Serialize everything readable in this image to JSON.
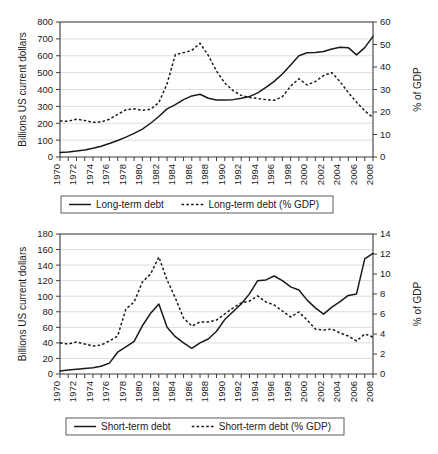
{
  "chart_data": [
    {
      "panel": "top",
      "type": "line",
      "title": "",
      "xlabel": "",
      "ylabel": "Billions US current dollars",
      "y2label": "% of GDP",
      "ylim": [
        0,
        800
      ],
      "yticks": [
        0,
        100,
        200,
        300,
        400,
        500,
        600,
        700,
        800
      ],
      "y2lim": [
        0,
        60
      ],
      "y2ticks": [
        0,
        10,
        20,
        30,
        40,
        50,
        60
      ],
      "grid": true,
      "legend_position": "below",
      "x": [
        1970,
        1971,
        1972,
        1973,
        1974,
        1975,
        1976,
        1977,
        1978,
        1979,
        1980,
        1981,
        1982,
        1983,
        1984,
        1985,
        1986,
        1987,
        1988,
        1989,
        1990,
        1991,
        1992,
        1993,
        1994,
        1995,
        1996,
        1997,
        1998,
        1999,
        2000,
        2001,
        2002,
        2003,
        2004,
        2005,
        2006,
        2007,
        2008
      ],
      "xticklabels": [
        "1970",
        "",
        "1972",
        "",
        "1974",
        "",
        "1976",
        "",
        "1978",
        "",
        "1980",
        "",
        "1982",
        "",
        "1984",
        "",
        "1986",
        "",
        "1988",
        "",
        "1990",
        "",
        "1992",
        "",
        "1994",
        "",
        "1996",
        "",
        "1998",
        "",
        "2000",
        "",
        "2002",
        "",
        "2004",
        "",
        "2006",
        "",
        "2008"
      ],
      "series": [
        {
          "name": "Long-term debt",
          "style": "solid",
          "axis": "left",
          "units": "Billions US current dollars",
          "values": [
            27,
            30,
            35,
            42,
            52,
            64,
            80,
            98,
            118,
            140,
            165,
            200,
            240,
            285,
            310,
            340,
            362,
            372,
            348,
            338,
            338,
            340,
            348,
            358,
            380,
            412,
            448,
            492,
            545,
            600,
            618,
            620,
            625,
            640,
            650,
            648,
            605,
            648,
            715
          ]
        },
        {
          "name": "Long-term debt (% GDP)",
          "style": "dashed",
          "axis": "right",
          "units": "% of GDP",
          "values": [
            16.0,
            15.9,
            16.8,
            16.2,
            15.4,
            15.6,
            16.8,
            18.9,
            21.0,
            21.4,
            20.8,
            21.2,
            24.2,
            32.5,
            45.5,
            46.4,
            47.4,
            50.5,
            45.2,
            38.2,
            32.9,
            29.5,
            27.4,
            26.4,
            26.0,
            25.5,
            25.2,
            26.8,
            31.5,
            34.8,
            32.0,
            33.5,
            36.2,
            37.5,
            33.5,
            28.6,
            24.4,
            20.5,
            17.5
          ]
        }
      ],
      "legend": [
        {
          "label": "Long-term debt",
          "style": "solid"
        },
        {
          "label": "Long-term debt (% GDP)",
          "style": "dashed"
        }
      ]
    },
    {
      "panel": "bottom",
      "type": "line",
      "title": "",
      "xlabel": "",
      "ylabel": "Billions US current dollars",
      "y2label": "% of GDP",
      "ylim": [
        0,
        180
      ],
      "yticks": [
        0,
        20,
        40,
        60,
        80,
        100,
        120,
        140,
        160,
        180
      ],
      "y2lim": [
        0,
        14
      ],
      "y2ticks": [
        0,
        2,
        4,
        6,
        8,
        10,
        12,
        14
      ],
      "grid": true,
      "legend_position": "below",
      "x": [
        1970,
        1971,
        1972,
        1973,
        1974,
        1975,
        1976,
        1977,
        1978,
        1979,
        1980,
        1981,
        1982,
        1983,
        1984,
        1985,
        1986,
        1987,
        1988,
        1989,
        1990,
        1991,
        1992,
        1993,
        1994,
        1995,
        1996,
        1997,
        1998,
        1999,
        2000,
        2001,
        2002,
        2003,
        2004,
        2005,
        2006,
        2007,
        2008
      ],
      "xticklabels": [
        "1970",
        "",
        "1972",
        "",
        "1974",
        "",
        "1976",
        "",
        "1978",
        "",
        "1980",
        "",
        "1982",
        "",
        "1984",
        "",
        "1986",
        "",
        "1988",
        "",
        "1990",
        "",
        "1992",
        "",
        "1994",
        "",
        "1996",
        "",
        "1998",
        "",
        "2000",
        "",
        "2002",
        "",
        "2004",
        "",
        "2006",
        "",
        "2008"
      ],
      "series": [
        {
          "name": "Short-term debt",
          "style": "solid",
          "axis": "left",
          "units": "Billions US current dollars",
          "values": [
            4,
            5,
            6,
            7,
            8,
            10,
            14,
            28,
            35,
            42,
            62,
            78,
            90,
            60,
            48,
            40,
            33,
            40,
            45,
            55,
            70,
            80,
            90,
            103,
            120,
            121,
            126,
            120,
            112,
            108,
            95,
            85,
            77,
            86,
            93,
            101,
            103,
            148,
            155
          ]
        },
        {
          "name": "Short-term debt (% GDP)",
          "style": "dashed",
          "axis": "right",
          "units": "% of GDP",
          "values": [
            3.1,
            3.0,
            3.2,
            3.0,
            2.8,
            2.9,
            3.3,
            3.8,
            6.5,
            7.2,
            9.2,
            10.0,
            11.7,
            9.4,
            7.6,
            5.6,
            4.8,
            5.2,
            5.2,
            5.4,
            6.0,
            6.6,
            7.1,
            7.3,
            7.8,
            7.2,
            6.9,
            6.3,
            5.7,
            6.2,
            5.4,
            4.5,
            4.4,
            4.5,
            4.1,
            3.8,
            3.3,
            4.0,
            3.7
          ]
        }
      ],
      "legend": [
        {
          "label": "Short-term debt",
          "style": "solid"
        },
        {
          "label": "Short-term debt (% GDP)",
          "style": "dashed"
        }
      ]
    }
  ]
}
